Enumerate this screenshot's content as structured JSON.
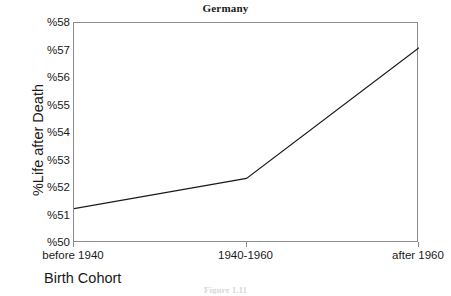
{
  "chart_data": {
    "type": "line",
    "title": "Germany",
    "xlabel": "Birth Cohort",
    "ylabel": "%Life after Death",
    "categories": [
      "before 1940",
      "1940-1960",
      "after 1960"
    ],
    "values": [
      51.25,
      52.35,
      57.1
    ],
    "ylim": [
      50,
      58
    ],
    "yticks": [
      "%50",
      "%51",
      "%52",
      "%53",
      "%54",
      "%55",
      "%56",
      "%57",
      "%58"
    ],
    "ytick_values": [
      50,
      51,
      52,
      53,
      54,
      55,
      56,
      57,
      58
    ],
    "grid": false,
    "legend": null,
    "series": [
      {
        "name": "Germany",
        "values": [
          51.25,
          52.35,
          57.1
        ]
      }
    ],
    "line_color": "#1a1a1a",
    "axis_color": "#8c8c8c"
  },
  "figure": {
    "caption": "Figure 1.11"
  }
}
